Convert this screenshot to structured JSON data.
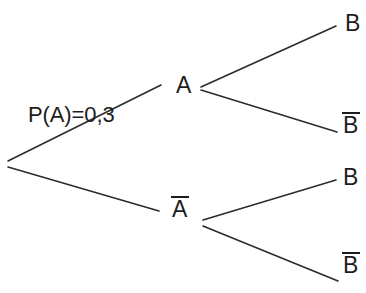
{
  "diagram": {
    "type": "probability-tree",
    "stroke_color": "#2b2b2b",
    "text_color": "#1d1d1d",
    "background_color": "#ffffff",
    "stroke_width": 1.6,
    "probability_label": "P(A)=0,3",
    "nodes": {
      "root": {
        "label": "",
        "x": 8,
        "y": 163
      },
      "a": {
        "label": "A",
        "x": 186,
        "y": 86,
        "complement": false
      },
      "a_bar": {
        "label": "A",
        "x": 182,
        "y": 210,
        "complement": true
      },
      "b1": {
        "label": "B",
        "x": 352,
        "y": 27,
        "complement": false
      },
      "b1_bar": {
        "label": "B",
        "x": 352,
        "y": 128,
        "complement": true
      },
      "b2": {
        "label": "B",
        "x": 352,
        "y": 181,
        "complement": false
      },
      "b2_bar": {
        "label": "B",
        "x": 352,
        "y": 272,
        "complement": true
      }
    },
    "edges": [
      {
        "name": "root-to-a",
        "x1": 8,
        "y1": 161,
        "x2": 161,
        "y2": 85
      },
      {
        "name": "root-to-a-bar",
        "x1": 8,
        "y1": 167,
        "x2": 159,
        "y2": 211
      },
      {
        "name": "a-to-b",
        "x1": 201,
        "y1": 87,
        "x2": 336,
        "y2": 26
      },
      {
        "name": "a-to-b-bar",
        "x1": 201,
        "y1": 90,
        "x2": 337,
        "y2": 132
      },
      {
        "name": "a-bar-to-b",
        "x1": 203,
        "y1": 220,
        "x2": 336,
        "y2": 180
      },
      {
        "name": "a-bar-to-b-bar",
        "x1": 203,
        "y1": 226,
        "x2": 338,
        "y2": 281
      }
    ]
  }
}
